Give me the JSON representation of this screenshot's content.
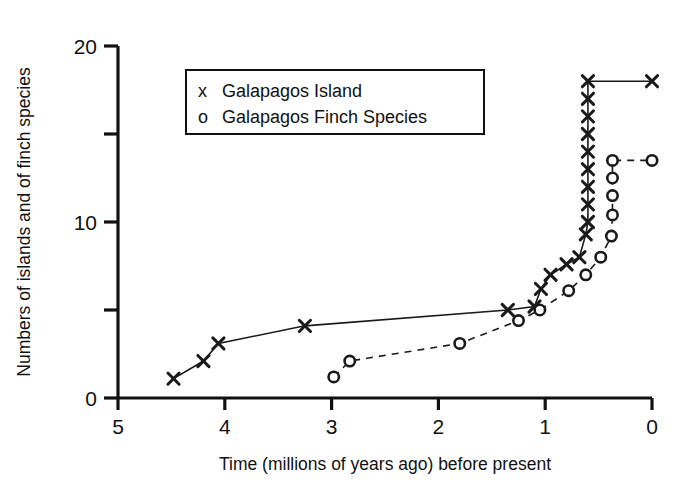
{
  "chart_data": {
    "type": "line",
    "title": "",
    "xlabel": "Time (millions of years ago) before present",
    "ylabel": "Numbers of islands and of finch species",
    "xlim": [
      5,
      0
    ],
    "ylim": [
      0,
      20
    ],
    "x_axis_reversed": true,
    "grid": false,
    "legend_position": "upper-left-inside",
    "xticks": [
      "5",
      "4",
      "3",
      "2",
      "1",
      "0"
    ],
    "xtick_values": [
      5,
      4,
      3,
      2,
      1,
      0
    ],
    "yticks": [
      "0",
      "10",
      "20"
    ],
    "ytick_values": [
      0,
      10,
      20
    ],
    "yminor_tick_values": [
      5,
      15
    ],
    "series": [
      {
        "name": "Galapagos Island",
        "marker": "x",
        "linestyle": "solid",
        "color": "#1a1a1a",
        "points": [
          [
            4.48,
            1.1
          ],
          [
            4.2,
            2.1
          ],
          [
            4.06,
            3.1
          ],
          [
            3.25,
            4.1
          ],
          [
            1.35,
            5.0
          ],
          [
            1.1,
            5.2
          ],
          [
            1.04,
            6.2
          ],
          [
            0.95,
            7.0
          ],
          [
            0.8,
            7.6
          ],
          [
            0.68,
            8.0
          ],
          [
            0.62,
            9.3
          ],
          [
            0.6,
            10.0
          ],
          [
            0.6,
            11.0
          ],
          [
            0.6,
            12.0
          ],
          [
            0.6,
            13.0
          ],
          [
            0.6,
            14.0
          ],
          [
            0.6,
            15.0
          ],
          [
            0.6,
            16.0
          ],
          [
            0.6,
            17.0
          ],
          [
            0.6,
            18.0
          ],
          [
            0.0,
            18.0
          ]
        ]
      },
      {
        "name": "Galapagos Finch Species",
        "marker": "o",
        "linestyle": "dashed",
        "color": "#1a1a1a",
        "points": [
          [
            2.98,
            1.2
          ],
          [
            2.83,
            2.1
          ],
          [
            1.8,
            3.1
          ],
          [
            1.25,
            4.4
          ],
          [
            1.05,
            5.0
          ],
          [
            0.78,
            6.1
          ],
          [
            0.62,
            7.0
          ],
          [
            0.48,
            8.0
          ],
          [
            0.38,
            9.2
          ],
          [
            0.37,
            10.4
          ],
          [
            0.37,
            11.5
          ],
          [
            0.37,
            12.5
          ],
          [
            0.37,
            13.5
          ],
          [
            0.0,
            13.5
          ]
        ]
      }
    ],
    "legend": [
      {
        "marker": "x",
        "label": "Galapagos Island"
      },
      {
        "marker": "o",
        "label": "Galapagos Finch Species"
      }
    ]
  }
}
